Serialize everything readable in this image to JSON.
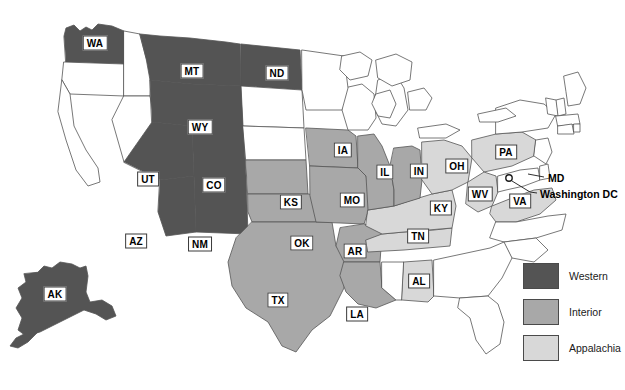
{
  "map": {
    "title": "US Coal Basin Regions Map",
    "colors": {
      "western": "#545454",
      "interior": "#a8a8a8",
      "appalachia": "#d8d8d8",
      "unshaded": "#ffffff",
      "outline": "#555555",
      "label_text": "#000000",
      "label_box": "#ffffff"
    },
    "states": [
      {
        "code": "WA",
        "region": "Western",
        "fill": "#545454",
        "x": 95,
        "y": 43
      },
      {
        "code": "MT",
        "region": "Western",
        "fill": "#545454",
        "x": 192,
        "y": 71
      },
      {
        "code": "ND",
        "region": "Western",
        "fill": "#545454",
        "x": 277,
        "y": 73
      },
      {
        "code": "WY",
        "region": "Western",
        "fill": "#545454",
        "x": 200,
        "y": 127
      },
      {
        "code": "UT",
        "region": "Western",
        "fill": "#545454",
        "x": 148,
        "y": 179
      },
      {
        "code": "CO",
        "region": "Western",
        "fill": "#545454",
        "x": 214,
        "y": 185
      },
      {
        "code": "AZ",
        "region": "Western",
        "fill": "#545454",
        "x": 136,
        "y": 241
      },
      {
        "code": "NM",
        "region": "Western",
        "fill": "#545454",
        "x": 200,
        "y": 244
      },
      {
        "code": "AK",
        "region": "Western",
        "fill": "#545454",
        "x": 55,
        "y": 294
      },
      {
        "code": "IA",
        "region": "Interior",
        "fill": "#a8a8a8",
        "x": 343,
        "y": 150
      },
      {
        "code": "IL",
        "region": "Interior",
        "fill": "#a8a8a8",
        "x": 385,
        "y": 172
      },
      {
        "code": "IN",
        "region": "Interior",
        "fill": "#a8a8a8",
        "x": 419,
        "y": 171
      },
      {
        "code": "MO",
        "region": "Interior",
        "fill": "#a8a8a8",
        "x": 352,
        "y": 200
      },
      {
        "code": "KS",
        "region": "Interior",
        "fill": "#a8a8a8",
        "x": 291,
        "y": 202
      },
      {
        "code": "OK",
        "region": "Interior",
        "fill": "#a8a8a8",
        "x": 302,
        "y": 243
      },
      {
        "code": "AR",
        "region": "Interior",
        "fill": "#a8a8a8",
        "x": 355,
        "y": 251
      },
      {
        "code": "TX",
        "region": "Interior",
        "fill": "#a8a8a8",
        "x": 278,
        "y": 300
      },
      {
        "code": "LA",
        "region": "Interior",
        "fill": "#a8a8a8",
        "x": 357,
        "y": 314
      },
      {
        "code": "OH",
        "region": "Appalachia",
        "fill": "#d8d8d8",
        "x": 457,
        "y": 166
      },
      {
        "code": "PA",
        "region": "Appalachia",
        "fill": "#d8d8d8",
        "x": 506,
        "y": 152
      },
      {
        "code": "WV",
        "region": "Appalachia",
        "fill": "#d8d8d8",
        "x": 480,
        "y": 194
      },
      {
        "code": "VA",
        "region": "Appalachia",
        "fill": "#d8d8d8",
        "x": 520,
        "y": 201
      },
      {
        "code": "KY",
        "region": "Appalachia",
        "fill": "#d8d8d8",
        "x": 441,
        "y": 208
      },
      {
        "code": "TN",
        "region": "Appalachia",
        "fill": "#d8d8d8",
        "x": 418,
        "y": 236
      },
      {
        "code": "AL",
        "region": "Appalachia",
        "fill": "#d8d8d8",
        "x": 419,
        "y": 281
      }
    ],
    "callouts": [
      {
        "id": "md",
        "label": "MD",
        "x": 548,
        "y": 178
      },
      {
        "id": "dc",
        "label": "Washington DC",
        "x": 540,
        "y": 194
      }
    ]
  },
  "legend": {
    "items": [
      {
        "label": "Western",
        "color": "#545454"
      },
      {
        "label": "Interior",
        "color": "#a8a8a8"
      },
      {
        "label": "Appalachia",
        "color": "#d8d8d8"
      }
    ]
  }
}
